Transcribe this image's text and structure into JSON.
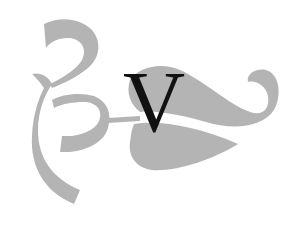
{
  "initial": {
    "letter": "V",
    "color": "#111111"
  },
  "ornament": {
    "fill": "#b4b4b4",
    "description": "decorative gray scrollwork flourish with leaf shapes"
  }
}
